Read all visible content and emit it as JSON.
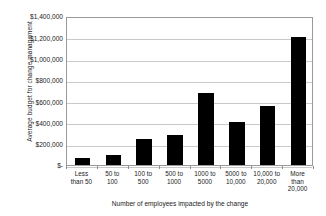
{
  "chart_data": {
    "type": "bar",
    "title": "",
    "xlabel": "Number of employees impacted by the change",
    "ylabel": "Average budget for change management",
    "categories": [
      "Less than 50",
      "50 to 100",
      "100 to 500",
      "500 to 1000",
      "1000 to 5000",
      "5000 to 10,000",
      "10,000 to 20,000",
      "More than 20,000"
    ],
    "category_lines": [
      [
        "Less",
        "than 50"
      ],
      [
        "50 to",
        "100"
      ],
      [
        "100 to",
        "500"
      ],
      [
        "500 to",
        "1000"
      ],
      [
        "1000 to",
        "5000"
      ],
      [
        "5000 to",
        "10,000"
      ],
      [
        "10,000 to",
        "20,000"
      ],
      [
        "More",
        "than",
        "20,000"
      ]
    ],
    "values": [
      70000,
      90000,
      240000,
      280000,
      680000,
      405000,
      550000,
      1205000
    ],
    "ylim": [
      0,
      1400000
    ],
    "ytick_values": [
      0,
      200000,
      400000,
      600000,
      800000,
      1000000,
      1200000,
      1400000
    ],
    "ytick_labels": [
      "$-",
      "$200,000",
      "$400,000",
      "$600,000",
      "$800,000",
      "$1,000,000",
      "$1,200,000",
      "$1,400,000"
    ],
    "grid": true,
    "grid_axis": "y",
    "legend": false,
    "legend_position": "none",
    "bar_color": "#000000",
    "grid_color": "#c9c9c9",
    "axis_color": "#9a9a9a",
    "background_color": "#ffffff"
  }
}
